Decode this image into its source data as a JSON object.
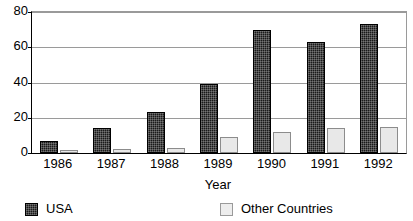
{
  "chart_data": {
    "type": "bar",
    "title": "",
    "xlabel": "Year",
    "ylabel": "",
    "categories": [
      "1986",
      "1987",
      "1988",
      "1989",
      "1990",
      "1991",
      "1992"
    ],
    "series": [
      {
        "name": "USA",
        "color": "#1a1a1a",
        "values": [
          7,
          14,
          23,
          39,
          70,
          63,
          73
        ]
      },
      {
        "name": "Other Countries",
        "color": "#e8e8e8",
        "values": [
          1.5,
          2.5,
          3,
          9,
          12,
          14,
          15
        ]
      }
    ],
    "ylim": [
      0,
      80
    ],
    "yticks": [
      0,
      20,
      40,
      60,
      80
    ],
    "ytick_labels": [
      "0",
      "20",
      "40",
      "60",
      "80"
    ],
    "grid": true,
    "grid_axis": "y",
    "legend_position": "bottom"
  },
  "legend": {
    "entries": [
      {
        "label": "USA",
        "swatch": "dark-hatched-square"
      },
      {
        "label": "Other Countries",
        "swatch": "light-gray-square"
      }
    ]
  },
  "axes": {
    "x_title": "Year"
  }
}
